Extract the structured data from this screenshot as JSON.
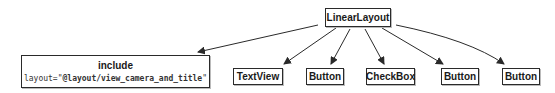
{
  "root": {
    "label": "LinearLayout"
  },
  "children": [
    {
      "label": "include",
      "attr_name": "layout=\"",
      "attr_value": "@layout/view_camera_and_title",
      "attr_close": "\""
    },
    {
      "label": "TextView"
    },
    {
      "label": "Button"
    },
    {
      "label": "CheckBox"
    },
    {
      "label": "Button"
    },
    {
      "label": "Button"
    }
  ],
  "colors": {
    "stroke": "#2a2a2a",
    "background": "#ffffff",
    "text": "#1a1a1a"
  }
}
